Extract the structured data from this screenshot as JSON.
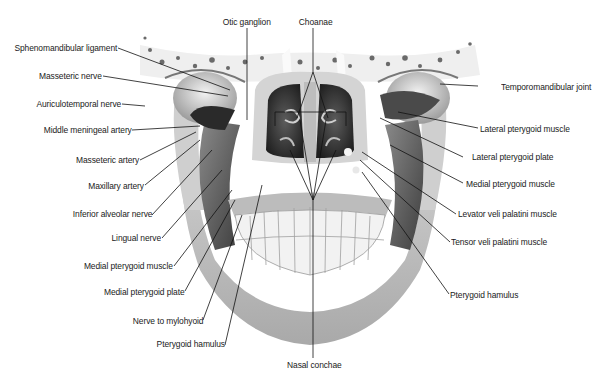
{
  "diagram": {
    "labels_left": [
      {
        "id": "sphenomandibular-ligament",
        "text": "Sphenomandibular ligament"
      },
      {
        "id": "masseteric-nerve",
        "text": "Masseteric nerve"
      },
      {
        "id": "auriculotemporal-nerve",
        "text": "Auriculotemporal nerve"
      },
      {
        "id": "middle-meningeal-artery",
        "text": "Middle meningeal artery"
      },
      {
        "id": "masseteric-artery",
        "text": "Masseteric artery"
      },
      {
        "id": "maxillary-artery",
        "text": "Maxillary artery"
      },
      {
        "id": "inferior-alveolar-nerve",
        "text": "Inferior alveolar nerve"
      },
      {
        "id": "lingual-nerve",
        "text": "Lingual nerve"
      },
      {
        "id": "medial-pterygoid-muscle-left",
        "text": "Medial pterygoid muscle"
      },
      {
        "id": "medial-pterygoid-plate",
        "text": "Medial pterygoid plate"
      },
      {
        "id": "nerve-to-mylohyoid",
        "text": "Nerve to mylohyoid"
      },
      {
        "id": "pterygoid-hamulus-left",
        "text": "Pterygoid hamulus"
      }
    ],
    "labels_top": [
      {
        "id": "otic-ganglion",
        "text": "Otic ganglion"
      },
      {
        "id": "choanae",
        "text": "Choanae"
      }
    ],
    "labels_right": [
      {
        "id": "temporomandibular-joint",
        "text": "Temporomandibular joint"
      },
      {
        "id": "lateral-pterygoid-muscle",
        "text": "Lateral pterygoid muscle"
      },
      {
        "id": "lateral-pterygoid-plate",
        "text": "Lateral pterygoid plate"
      },
      {
        "id": "medial-pterygoid-muscle-right",
        "text": "Medial pterygoid muscle"
      },
      {
        "id": "levator-veli-palatini-muscle",
        "text": "Levator veli palatini muscle"
      },
      {
        "id": "tensor-veli-palatini-muscle",
        "text": "Tensor veli palatini muscle"
      },
      {
        "id": "pterygoid-hamulus-right",
        "text": "Pterygoid hamulus"
      }
    ],
    "labels_bottom": [
      {
        "id": "nasal-conchae",
        "text": "Nasal conchae"
      }
    ],
    "colors": {
      "bone_light": "#e6e6e6",
      "bone_mid": "#bdbdbd",
      "shadow": "#3a3a3a",
      "leader_line": "#111111",
      "text": "#1a1a1a"
    }
  }
}
